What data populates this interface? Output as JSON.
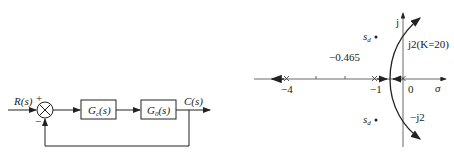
{
  "block_diagram": {
    "input_label": "R(s)",
    "output_label": "C(s)",
    "plus_sign": "+",
    "minus_sign": "−",
    "blocks": [
      {
        "label": "Gc(s)",
        "main": "G",
        "sub": "c",
        "rest": "(s)"
      },
      {
        "label": "G0(s)",
        "main": "G",
        "sub": "0",
        "rest": "(s)"
      }
    ]
  },
  "root_locus": {
    "axis_real_label": "σ",
    "axis_imag_label": "j",
    "tick_labels": {
      "minus4": "−4",
      "minus1": "−1",
      "zero": "0"
    },
    "breakaway_label": "−0.465",
    "upper_crossing_label": "j2(K=20)",
    "lower_crossing_label": "−j2",
    "sd_label": "s",
    "sd_sub": "d",
    "poles": [
      0,
      -1,
      -4
    ]
  }
}
